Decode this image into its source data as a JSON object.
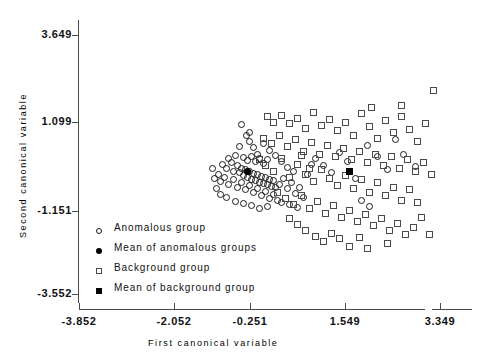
{
  "chart_data": {
    "type": "scatter",
    "title": "",
    "xlabel": "First canonical variable",
    "ylabel": "Second canonical variable",
    "xlim": [
      -3.852,
      3.349
    ],
    "ylim": [
      -3.552,
      3.649
    ],
    "xticks": [
      -3.852,
      -2.052,
      -0.251,
      1.549,
      3.349
    ],
    "xtick_labels": [
      "-3.852",
      "-2.052",
      "-0.251",
      "1.549",
      "3.349"
    ],
    "yticks": [
      -3.552,
      -1.151,
      1.099,
      3.649
    ],
    "ytick_labels": [
      "-3.552",
      "-1.151",
      "1.099",
      "3.649"
    ],
    "grid": false,
    "legend_position": "inside-lower-left",
    "series": [
      {
        "name": "Anomalous group",
        "marker": "open-circle",
        "color": "#1a1a1a",
        "points": [
          [
            -0.62,
            1.17
          ],
          [
            -0.52,
            0.86
          ],
          [
            -0.46,
            0.95
          ],
          [
            -0.46,
            0.7
          ],
          [
            -0.66,
            0.55
          ],
          [
            -0.38,
            0.52
          ],
          [
            -0.3,
            0.34
          ],
          [
            -0.86,
            0.22
          ],
          [
            -0.74,
            0.3
          ],
          [
            -0.58,
            0.23
          ],
          [
            -0.5,
            0.16
          ],
          [
            -0.42,
            0.26
          ],
          [
            -0.34,
            0.12
          ],
          [
            -0.26,
            0.22
          ],
          [
            -0.18,
            0.08
          ],
          [
            -0.1,
            0.18
          ],
          [
            -0.98,
            0.05
          ],
          [
            -0.9,
            -0.06
          ],
          [
            -0.82,
            0.1
          ],
          [
            -0.78,
            -0.14
          ],
          [
            -0.7,
            0.02
          ],
          [
            -0.66,
            -0.18
          ],
          [
            -0.62,
            -0.06
          ],
          [
            -0.58,
            -0.26
          ],
          [
            -0.54,
            -0.1
          ],
          [
            -0.5,
            -0.3
          ],
          [
            -0.46,
            -0.16
          ],
          [
            -0.42,
            -0.36
          ],
          [
            -0.38,
            -0.2
          ],
          [
            -0.34,
            -0.4
          ],
          [
            -0.3,
            -0.24
          ],
          [
            -0.26,
            -0.44
          ],
          [
            -0.22,
            -0.28
          ],
          [
            -0.18,
            -0.48
          ],
          [
            -0.14,
            -0.32
          ],
          [
            -0.1,
            -0.52
          ],
          [
            -0.06,
            -0.36
          ],
          [
            -0.02,
            -0.56
          ],
          [
            0.02,
            -0.4
          ],
          [
            0.06,
            -0.6
          ],
          [
            -1.06,
            -0.22
          ],
          [
            -1.02,
            -0.42
          ],
          [
            -0.94,
            -0.3
          ],
          [
            -0.86,
            -0.5
          ],
          [
            -0.78,
            -0.38
          ],
          [
            -0.7,
            -0.58
          ],
          [
            -0.62,
            -0.46
          ],
          [
            -0.54,
            -0.66
          ],
          [
            -0.46,
            -0.54
          ],
          [
            -0.38,
            -0.74
          ],
          [
            -0.3,
            -0.62
          ],
          [
            -0.22,
            -0.82
          ],
          [
            -0.14,
            -0.7
          ],
          [
            -0.06,
            -0.9
          ],
          [
            0.02,
            -0.78
          ],
          [
            0.1,
            -0.94
          ],
          [
            -1.1,
            -0.62
          ],
          [
            -1.02,
            -0.78
          ],
          [
            -0.9,
            -0.86
          ],
          [
            -0.74,
            -0.98
          ],
          [
            -0.58,
            -1.04
          ],
          [
            -0.42,
            -1.1
          ],
          [
            -0.26,
            -1.18
          ],
          [
            -0.1,
            -1.12
          ],
          [
            0.14,
            -0.5
          ],
          [
            0.22,
            -0.34
          ],
          [
            0.3,
            -0.62
          ],
          [
            0.38,
            -0.46
          ],
          [
            0.46,
            -0.76
          ],
          [
            0.54,
            -0.58
          ],
          [
            0.62,
            -0.88
          ],
          [
            0.18,
            -1.0
          ],
          [
            0.34,
            -1.06
          ],
          [
            0.5,
            -1.14
          ],
          [
            -0.18,
            0.62
          ],
          [
            -0.06,
            0.44
          ],
          [
            0.06,
            0.3
          ],
          [
            0.18,
            0.12
          ],
          [
            0.3,
            -0.04
          ],
          [
            0.42,
            -0.16
          ],
          [
            0.86,
            0.22
          ],
          [
            1.02,
            0.02
          ],
          [
            1.18,
            -0.18
          ],
          [
            1.34,
            0.38
          ],
          [
            1.5,
            0.12
          ],
          [
            1.66,
            -0.34
          ],
          [
            1.9,
            0.58
          ],
          [
            2.1,
            0.26
          ],
          [
            2.3,
            -0.1
          ],
          [
            2.46,
            0.74
          ],
          [
            2.62,
            0.34
          ],
          [
            2.86,
            -0.02
          ],
          [
            1.78,
            -0.96
          ],
          [
            1.94,
            -1.12
          ],
          [
            -1.18,
            -0.06
          ],
          [
            -1.14,
            -0.34
          ],
          [
            0.7,
            -0.22
          ],
          [
            0.78,
            0.06
          ]
        ]
      },
      {
        "name": "Mean of anomalous groups",
        "marker": "filled-circle",
        "color": "#000000",
        "points": [
          [
            -0.5,
            -0.16
          ]
        ]
      },
      {
        "name": "Background group",
        "marker": "open-square",
        "color": "#4a4a4a",
        "points": [
          [
            -0.1,
            1.38
          ],
          [
            0.02,
            1.22
          ],
          [
            0.18,
            1.42
          ],
          [
            0.34,
            1.18
          ],
          [
            0.5,
            1.34
          ],
          [
            0.66,
            1.06
          ],
          [
            0.82,
            1.5
          ],
          [
            0.98,
            1.14
          ],
          [
            1.14,
            1.3
          ],
          [
            1.3,
            0.98
          ],
          [
            1.46,
            1.22
          ],
          [
            1.62,
            0.86
          ],
          [
            1.78,
            1.46
          ],
          [
            1.94,
            1.1
          ],
          [
            2.1,
            0.78
          ],
          [
            2.26,
            1.26
          ],
          [
            2.42,
            0.94
          ],
          [
            2.58,
            1.38
          ],
          [
            2.74,
            1.02
          ],
          [
            2.9,
            0.7
          ],
          [
            3.06,
            1.18
          ],
          [
            3.22,
            2.1
          ],
          [
            2.58,
            1.7
          ],
          [
            1.98,
            1.62
          ],
          [
            -0.18,
            0.78
          ],
          [
            -0.02,
            0.62
          ],
          [
            0.14,
            0.86
          ],
          [
            0.3,
            0.54
          ],
          [
            0.46,
            0.74
          ],
          [
            0.62,
            0.42
          ],
          [
            0.78,
            0.66
          ],
          [
            0.94,
            0.34
          ],
          [
            1.1,
            0.58
          ],
          [
            1.26,
            0.26
          ],
          [
            1.42,
            0.5
          ],
          [
            1.58,
            0.18
          ],
          [
            1.74,
            0.42
          ],
          [
            1.9,
            0.1
          ],
          [
            2.06,
            0.34
          ],
          [
            2.22,
            0.02
          ],
          [
            2.38,
            0.26
          ],
          [
            2.54,
            -0.06
          ],
          [
            2.7,
            0.18
          ],
          [
            2.86,
            -0.14
          ],
          [
            3.02,
            0.1
          ],
          [
            3.18,
            -0.22
          ],
          [
            -0.26,
            0.18
          ],
          [
            -0.14,
            0.02
          ],
          [
            0.02,
            -0.14
          ],
          [
            0.18,
            0.22
          ],
          [
            0.34,
            -0.3
          ],
          [
            0.5,
            0.06
          ],
          [
            0.66,
            -0.22
          ],
          [
            0.82,
            -0.42
          ],
          [
            0.98,
            -0.1
          ],
          [
            1.14,
            -0.34
          ],
          [
            1.3,
            -0.54
          ],
          [
            1.46,
            -0.26
          ],
          [
            1.62,
            -0.62
          ],
          [
            1.78,
            -0.38
          ],
          [
            1.94,
            -0.74
          ],
          [
            2.1,
            -0.46
          ],
          [
            2.26,
            -0.82
          ],
          [
            2.42,
            -0.58
          ],
          [
            2.58,
            -0.94
          ],
          [
            2.74,
            -0.66
          ],
          [
            2.9,
            -1.02
          ],
          [
            0.1,
            -0.74
          ],
          [
            0.26,
            -0.9
          ],
          [
            0.42,
            -1.06
          ],
          [
            0.58,
            -0.82
          ],
          [
            0.74,
            -1.18
          ],
          [
            0.9,
            -0.98
          ],
          [
            1.06,
            -1.3
          ],
          [
            1.22,
            -1.1
          ],
          [
            1.38,
            -1.42
          ],
          [
            1.54,
            -1.22
          ],
          [
            1.7,
            -1.54
          ],
          [
            1.86,
            -1.34
          ],
          [
            2.02,
            -1.66
          ],
          [
            2.18,
            -1.46
          ],
          [
            2.34,
            -1.78
          ],
          [
            2.5,
            -1.58
          ],
          [
            2.66,
            -1.9
          ],
          [
            0.34,
            -1.46
          ],
          [
            0.5,
            -1.62
          ],
          [
            0.66,
            -1.78
          ],
          [
            0.86,
            -1.94
          ],
          [
            1.02,
            -2.1
          ],
          [
            1.18,
            -1.86
          ],
          [
            1.34,
            -2.02
          ],
          [
            1.54,
            -2.22
          ],
          [
            1.74,
            -1.98
          ],
          [
            1.9,
            -2.3
          ],
          [
            2.82,
            -1.7
          ],
          [
            2.98,
            -1.42
          ],
          [
            3.14,
            -1.9
          ],
          [
            2.3,
            -2.14
          ],
          [
            0.74,
            -0.06
          ],
          [
            0.58,
            0.3
          ]
        ]
      },
      {
        "name": "Mean of background group",
        "marker": "filled-square",
        "color": "#000000",
        "points": [
          [
            1.55,
            -0.14
          ]
        ]
      }
    ]
  },
  "axes": {
    "ylabel": "Second canonical variable",
    "xlabel": "First canonical variable",
    "ytick_labels": [
      "3.649",
      "1.099",
      "-1.151",
      "-3.552"
    ],
    "xtick_labels": [
      "-3.852",
      "-2.052",
      "-0.251",
      "1.549",
      "3.349"
    ]
  },
  "legend": {
    "items": [
      {
        "marker": "open-circle",
        "label": "Anomalous group"
      },
      {
        "marker": "filled-circle",
        "label": "Mean of anomalous groups"
      },
      {
        "marker": "open-square",
        "label": "Background group"
      },
      {
        "marker": "filled-square",
        "label": "Mean of background group"
      }
    ]
  },
  "colors": {
    "axis": "#4a4a4a",
    "anomalous": "#1a1a1a",
    "background": "#4a4a4a",
    "mean": "#000000",
    "page_background": "#ffffff"
  }
}
